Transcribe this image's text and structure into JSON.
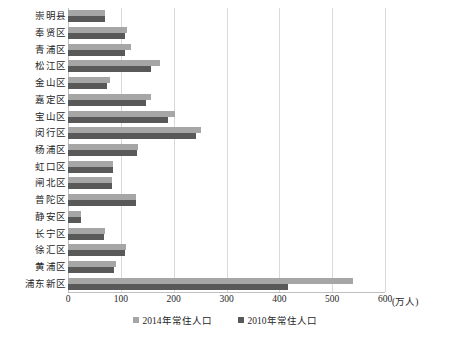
{
  "chart_data": {
    "type": "bar",
    "orientation": "horizontal",
    "title": "",
    "subtitle": "",
    "xlabel": "(万人)",
    "ylabel": "",
    "xlim": [
      0,
      600
    ],
    "xticks": [
      0,
      100,
      200,
      300,
      400,
      500,
      600
    ],
    "xtick_labels": [
      "0",
      "100",
      "200",
      "300",
      "400",
      "500",
      "600"
    ],
    "unit_label": "(万人)",
    "grid": true,
    "grid_axis": "x",
    "legend_position": "bottom",
    "categories": [
      "崇明县",
      "奉贤区",
      "青浦区",
      "松江区",
      "金山区",
      "嘉定区",
      "宝山区",
      "闵行区",
      "杨浦区",
      "虹口区",
      "闸北区",
      "普陀区",
      "静安区",
      "长宁区",
      "徐汇区",
      "黄浦区",
      "浦东新区"
    ],
    "series": [
      {
        "name": "2014年常住人口",
        "color": "#a6a6a6",
        "values": [
          70,
          112,
          120,
          174,
          80,
          158,
          202,
          251,
          132,
          85,
          83,
          129,
          25,
          70,
          109,
          90,
          540
        ]
      },
      {
        "name": "2010年常住人口",
        "color": "#595959",
        "values": [
          70,
          108,
          108,
          158,
          73,
          147,
          190,
          243,
          131,
          85,
          83,
          128,
          25,
          69,
          108,
          88,
          417
        ]
      }
    ],
    "legend": [
      {
        "label": "2014年常住人口",
        "color": "#a6a6a6",
        "swatch": "square-swatch"
      },
      {
        "label": "2010年常住人口",
        "color": "#595959",
        "swatch": "square-swatch"
      }
    ]
  }
}
